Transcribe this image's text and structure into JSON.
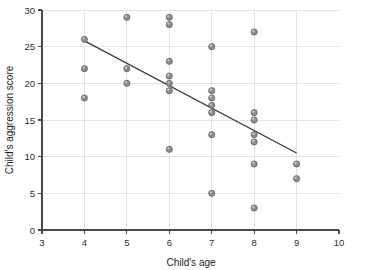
{
  "chart_data": {
    "type": "scatter",
    "title": "",
    "xlabel": "Child's age",
    "ylabel": "Child's aggression score",
    "xlim": [
      3,
      10
    ],
    "ylim": [
      0,
      30
    ],
    "xticks": [
      "3",
      "4",
      "5",
      "6",
      "7",
      "8",
      "9",
      "10"
    ],
    "yticks": [
      "0",
      "5",
      "10",
      "15",
      "20",
      "25",
      "30"
    ],
    "grid": true,
    "legend": "none",
    "marker_color": "#8d8d8d",
    "line_color": "#3d3d3d",
    "points": [
      {
        "x": 4,
        "y": 26
      },
      {
        "x": 4,
        "y": 22
      },
      {
        "x": 4,
        "y": 18
      },
      {
        "x": 5,
        "y": 29
      },
      {
        "x": 5,
        "y": 22
      },
      {
        "x": 5,
        "y": 20
      },
      {
        "x": 6,
        "y": 29
      },
      {
        "x": 6,
        "y": 28
      },
      {
        "x": 6,
        "y": 23
      },
      {
        "x": 6,
        "y": 21
      },
      {
        "x": 6,
        "y": 20
      },
      {
        "x": 6,
        "y": 19
      },
      {
        "x": 6,
        "y": 11
      },
      {
        "x": 7,
        "y": 25
      },
      {
        "x": 7,
        "y": 19
      },
      {
        "x": 7,
        "y": 18
      },
      {
        "x": 7,
        "y": 17
      },
      {
        "x": 7,
        "y": 16
      },
      {
        "x": 7,
        "y": 13
      },
      {
        "x": 7,
        "y": 5
      },
      {
        "x": 8,
        "y": 27
      },
      {
        "x": 8,
        "y": 16
      },
      {
        "x": 8,
        "y": 15
      },
      {
        "x": 8,
        "y": 13
      },
      {
        "x": 8,
        "y": 12
      },
      {
        "x": 8,
        "y": 9
      },
      {
        "x": 8,
        "y": 3
      },
      {
        "x": 9,
        "y": 9
      },
      {
        "x": 9,
        "y": 7
      }
    ],
    "trend_line": {
      "x1": 4,
      "y1": 25.8,
      "x2": 9,
      "y2": 10.5
    }
  }
}
